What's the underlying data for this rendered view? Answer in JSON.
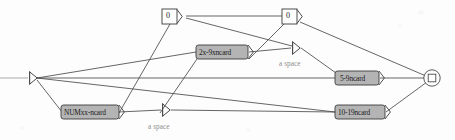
{
  "diagram": {
    "kind": "railroad-syntax-diagram",
    "title": "",
    "colors": {
      "background": "#fdfdfd",
      "line": "#4a4a4a",
      "node_fill_gray": "#b4b4b4",
      "node_fill_white": "#ffffff",
      "node_stroke": "#3a3a3a",
      "text": "#1a1a1a",
      "annotation_text": "#8d8d8d"
    },
    "start_node": {
      "name": "start-terminal",
      "shape": "arrowhead",
      "x": 32,
      "y": 78
    },
    "end_node": {
      "name": "end-terminal",
      "shape": "circle-with-square",
      "x": 432,
      "y": 78
    },
    "nodes": [
      {
        "id": "zero_top_left",
        "label": "0",
        "style": "white-box",
        "x": 170,
        "y": 16,
        "w": 16,
        "h": 15
      },
      {
        "id": "zero_top_right",
        "label": "0",
        "style": "white-box",
        "x": 290,
        "y": 16,
        "w": 16,
        "h": 15
      },
      {
        "id": "x2_9x",
        "label": "2x-9xncard",
        "style": "gray-box",
        "x": 222,
        "y": 52,
        "w": 52,
        "h": 14
      },
      {
        "id": "numxx",
        "label": "NUMxx-ncard",
        "style": "gray-box",
        "x": 90,
        "y": 112,
        "w": 58,
        "h": 14
      },
      {
        "id": "n5_9",
        "label": "5-9ncard",
        "style": "gray-box",
        "x": 357,
        "y": 77,
        "w": 44,
        "h": 14
      },
      {
        "id": "n10_19",
        "label": "10-19ncard",
        "style": "gray-box",
        "x": 360,
        "y": 112,
        "w": 50,
        "h": 14
      }
    ],
    "annotations": [
      {
        "id": "space_upper",
        "label": "a space",
        "x": 296,
        "y": 64
      },
      {
        "id": "space_lower",
        "label": "a space",
        "x": 166,
        "y": 127
      }
    ],
    "edge_markers": [
      {
        "id": "marker_upper",
        "shape": "arrowhead",
        "x": 296,
        "y": 48
      },
      {
        "id": "marker_lower",
        "shape": "arrowhead",
        "x": 166,
        "y": 110
      }
    ]
  }
}
